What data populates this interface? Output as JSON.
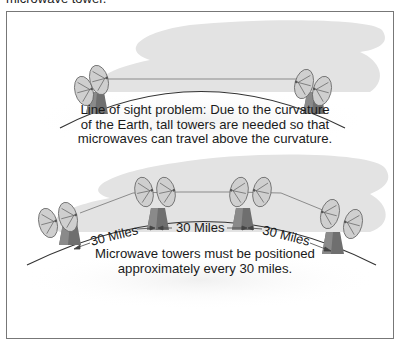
{
  "header": {
    "cut_off_caption": "microwave tower."
  },
  "diagram_top": {
    "description_lines": [
      "Line of sight problem: Due to the curvature",
      "of the Earth, tall towers are needed so that",
      "microwaves can travel above the curvature."
    ],
    "towers": 2
  },
  "diagram_bottom": {
    "distance_labels": [
      "30 Miles",
      "30 Miles",
      "30 Miles"
    ],
    "description_lines": [
      "Microwave towers must be positioned",
      "approximately every 30 miles."
    ],
    "towers": 4
  },
  "colors": {
    "frame_border": "#777777",
    "cloud_gray": "#e4e4e4",
    "dish_fill": "#c9c9c9",
    "tower_dark": "#6b6b6b",
    "earth_line": "#333333"
  }
}
